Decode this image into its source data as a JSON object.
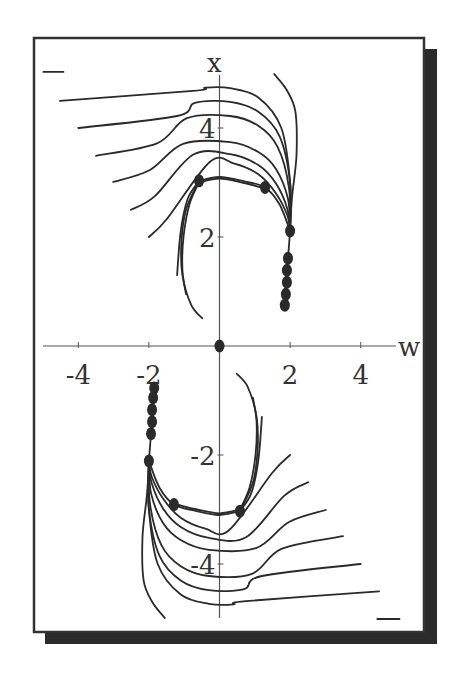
{
  "chart_data": {
    "type": "line",
    "title": "",
    "xlabel": "w",
    "ylabel": "x",
    "xlim": [
      -5.1,
      5.1
    ],
    "ylim": [
      -5.2,
      5.5
    ],
    "grid": false,
    "legend": null,
    "x_ticks": [
      {
        "value": -4,
        "label": "-4"
      },
      {
        "value": -2,
        "label": "-2"
      },
      {
        "value": 2,
        "label": "2"
      },
      {
        "value": 4,
        "label": "4"
      }
    ],
    "y_ticks": [
      {
        "value": 4,
        "label": "4"
      },
      {
        "value": 2,
        "label": "2"
      },
      {
        "value": -2,
        "label": "-2"
      },
      {
        "value": -4,
        "label": "-4"
      }
    ],
    "points": [
      {
        "w": 0.0,
        "x": 0.0
      },
      {
        "w": -0.58,
        "x": 3.03
      },
      {
        "w": 1.29,
        "x": 2.91
      },
      {
        "w": 2.0,
        "x": 2.11
      },
      {
        "w": 1.94,
        "x": 1.61
      },
      {
        "w": 1.91,
        "x": 1.39
      },
      {
        "w": 1.91,
        "x": 1.17
      },
      {
        "w": 1.88,
        "x": 0.95
      },
      {
        "w": 1.85,
        "x": 0.75
      },
      {
        "w": 0.58,
        "x": -3.03
      },
      {
        "w": -1.29,
        "x": -2.91
      },
      {
        "w": -2.0,
        "x": -2.11
      },
      {
        "w": -1.94,
        "x": -1.61
      },
      {
        "w": -1.91,
        "x": -1.39
      },
      {
        "w": -1.91,
        "x": -1.17
      },
      {
        "w": -1.88,
        "x": -0.95
      },
      {
        "w": -1.85,
        "x": -0.77
      }
    ],
    "series": [
      {
        "name": "upper-outer-1",
        "points": [
          [
            -4.52,
            4.5
          ],
          [
            -0.75,
            4.68
          ],
          [
            -0.4,
            4.74
          ],
          [
            0.3,
            4.73
          ],
          [
            1.1,
            4.56
          ],
          [
            1.75,
            4.0
          ],
          [
            2.0,
            3.0
          ],
          [
            2.0,
            2.11
          ]
        ]
      },
      {
        "name": "upper-outer-2",
        "points": [
          [
            -4.0,
            4.0
          ],
          [
            -1.2,
            4.22
          ],
          [
            -0.7,
            4.46
          ],
          [
            0.3,
            4.48
          ],
          [
            1.1,
            4.3
          ],
          [
            1.7,
            3.85
          ],
          [
            2.0,
            3.0
          ],
          [
            2.0,
            2.11
          ]
        ]
      },
      {
        "name": "upper-outer-3",
        "points": [
          [
            -3.5,
            3.49
          ],
          [
            -1.77,
            3.72
          ],
          [
            -0.92,
            4.18
          ],
          [
            0.3,
            4.22
          ],
          [
            1.1,
            4.04
          ],
          [
            1.65,
            3.65
          ],
          [
            1.97,
            2.9
          ],
          [
            2.0,
            2.11
          ]
        ]
      },
      {
        "name": "upper-outer-4",
        "points": [
          [
            -3.01,
            3.01
          ],
          [
            -1.97,
            3.23
          ],
          [
            -1.03,
            3.71
          ],
          [
            0.3,
            3.74
          ],
          [
            1.1,
            3.56
          ],
          [
            1.6,
            3.25
          ],
          [
            1.94,
            2.7
          ],
          [
            2.0,
            2.11
          ]
        ]
      },
      {
        "name": "upper-outer-5",
        "points": [
          [
            -2.51,
            2.5
          ],
          [
            -1.83,
            2.75
          ],
          [
            -0.75,
            3.51
          ],
          [
            0.3,
            3.52
          ],
          [
            1.1,
            3.32
          ],
          [
            1.6,
            2.98
          ],
          [
            1.92,
            2.52
          ],
          [
            2.0,
            2.11
          ]
        ]
      },
      {
        "name": "upper-outer-6",
        "points": [
          [
            -2.0,
            2.0
          ],
          [
            -1.49,
            2.33
          ],
          [
            -0.27,
            3.38
          ],
          [
            0.4,
            3.35
          ],
          [
            1.1,
            3.15
          ],
          [
            1.6,
            2.8
          ],
          [
            1.92,
            2.4
          ],
          [
            2.0,
            2.11
          ]
        ]
      },
      {
        "name": "upper-separatrix-a",
        "points": [
          [
            -0.58,
            3.03
          ],
          [
            0.0,
            3.1
          ],
          [
            0.7,
            3.02
          ],
          [
            1.29,
            2.91
          ],
          [
            1.7,
            2.6
          ],
          [
            2.0,
            2.11
          ]
        ]
      },
      {
        "name": "upper-separatrix-b",
        "points": [
          [
            -0.58,
            3.0
          ],
          [
            0.0,
            3.07
          ],
          [
            0.7,
            2.99
          ],
          [
            1.29,
            2.89
          ]
        ]
      },
      {
        "name": "upper-hook",
        "points": [
          [
            1.55,
            4.99
          ],
          [
            1.9,
            4.7
          ],
          [
            2.15,
            4.3
          ],
          [
            2.18,
            3.5
          ],
          [
            2.05,
            2.7
          ],
          [
            2.0,
            2.11
          ]
        ]
      },
      {
        "name": "upper-vertical",
        "points": [
          [
            2.0,
            2.11
          ],
          [
            1.94,
            1.61
          ],
          [
            1.85,
            0.75
          ]
        ]
      },
      {
        "name": "upper-inner-1",
        "points": [
          [
            -0.58,
            3.03
          ],
          [
            -0.9,
            2.7
          ],
          [
            -1.1,
            2.1
          ],
          [
            -1.2,
            1.3
          ]
        ]
      },
      {
        "name": "upper-inner-2",
        "points": [
          [
            -0.58,
            3.0
          ],
          [
            -0.85,
            2.6
          ],
          [
            -1.02,
            2.0
          ],
          [
            -1.05,
            1.4
          ],
          [
            -0.95,
            0.95
          ]
        ]
      },
      {
        "name": "upper-inner-3",
        "points": [
          [
            -0.62,
            2.98
          ],
          [
            -0.95,
            2.5
          ],
          [
            -1.08,
            1.9
          ],
          [
            -1.05,
            1.3
          ],
          [
            -0.8,
            0.75
          ],
          [
            -0.49,
            0.51
          ]
        ]
      },
      {
        "name": "lower-outer-1",
        "points": [
          [
            4.52,
            -4.5
          ],
          [
            0.75,
            -4.68
          ],
          [
            0.4,
            -4.74
          ],
          [
            -0.3,
            -4.73
          ],
          [
            -1.1,
            -4.56
          ],
          [
            -1.75,
            -4.0
          ],
          [
            -2.0,
            -3.0
          ],
          [
            -2.0,
            -2.11
          ]
        ]
      },
      {
        "name": "lower-outer-2",
        "points": [
          [
            4.0,
            -4.0
          ],
          [
            1.2,
            -4.22
          ],
          [
            0.7,
            -4.46
          ],
          [
            -0.3,
            -4.48
          ],
          [
            -1.1,
            -4.3
          ],
          [
            -1.7,
            -3.85
          ],
          [
            -2.0,
            -3.0
          ],
          [
            -2.0,
            -2.11
          ]
        ]
      },
      {
        "name": "lower-outer-3",
        "points": [
          [
            3.5,
            -3.49
          ],
          [
            1.77,
            -3.72
          ],
          [
            0.92,
            -4.18
          ],
          [
            -0.3,
            -4.22
          ],
          [
            -1.1,
            -4.04
          ],
          [
            -1.65,
            -3.65
          ],
          [
            -1.97,
            -2.9
          ],
          [
            -2.0,
            -2.11
          ]
        ]
      },
      {
        "name": "lower-outer-4",
        "points": [
          [
            3.01,
            -3.01
          ],
          [
            1.97,
            -3.23
          ],
          [
            1.03,
            -3.71
          ],
          [
            -0.3,
            -3.74
          ],
          [
            -1.1,
            -3.56
          ],
          [
            -1.6,
            -3.25
          ],
          [
            -1.94,
            -2.7
          ],
          [
            -2.0,
            -2.11
          ]
        ]
      },
      {
        "name": "lower-outer-5",
        "points": [
          [
            2.51,
            -2.5
          ],
          [
            1.83,
            -2.75
          ],
          [
            0.75,
            -3.51
          ],
          [
            -0.3,
            -3.52
          ],
          [
            -1.1,
            -3.32
          ],
          [
            -1.6,
            -2.98
          ],
          [
            -1.92,
            -2.52
          ],
          [
            -2.0,
            -2.11
          ]
        ]
      },
      {
        "name": "lower-outer-6",
        "points": [
          [
            2.0,
            -2.0
          ],
          [
            1.49,
            -2.33
          ],
          [
            0.27,
            -3.38
          ],
          [
            -0.4,
            -3.35
          ],
          [
            -1.1,
            -3.15
          ],
          [
            -1.6,
            -2.8
          ],
          [
            -1.92,
            -2.4
          ],
          [
            -2.0,
            -2.11
          ]
        ]
      },
      {
        "name": "lower-separatrix-a",
        "points": [
          [
            0.58,
            -3.03
          ],
          [
            0.0,
            -3.1
          ],
          [
            -0.7,
            -3.02
          ],
          [
            -1.29,
            -2.91
          ],
          [
            -1.7,
            -2.6
          ],
          [
            -2.0,
            -2.11
          ]
        ]
      },
      {
        "name": "lower-separatrix-b",
        "points": [
          [
            0.58,
            -3.0
          ],
          [
            0.0,
            -3.07
          ],
          [
            -0.7,
            -2.99
          ],
          [
            -1.29,
            -2.89
          ]
        ]
      },
      {
        "name": "lower-hook",
        "points": [
          [
            -1.55,
            -4.99
          ],
          [
            -1.9,
            -4.7
          ],
          [
            -2.15,
            -4.3
          ],
          [
            -2.18,
            -3.5
          ],
          [
            -2.05,
            -2.7
          ],
          [
            -2.0,
            -2.11
          ]
        ]
      },
      {
        "name": "lower-vertical",
        "points": [
          [
            -2.0,
            -2.11
          ],
          [
            -1.94,
            -1.61
          ],
          [
            -1.85,
            -0.77
          ]
        ]
      },
      {
        "name": "lower-inner-1",
        "points": [
          [
            0.58,
            -3.03
          ],
          [
            0.9,
            -2.7
          ],
          [
            1.1,
            -2.1
          ],
          [
            1.2,
            -1.3
          ]
        ]
      },
      {
        "name": "lower-inner-2",
        "points": [
          [
            0.58,
            -3.0
          ],
          [
            0.85,
            -2.6
          ],
          [
            1.02,
            -2.0
          ],
          [
            1.05,
            -1.4
          ],
          [
            0.95,
            -0.95
          ]
        ]
      },
      {
        "name": "lower-inner-3",
        "points": [
          [
            0.62,
            -2.98
          ],
          [
            0.95,
            -2.5
          ],
          [
            1.08,
            -1.9
          ],
          [
            1.05,
            -1.3
          ],
          [
            0.8,
            -0.75
          ],
          [
            0.49,
            -0.51
          ]
        ]
      },
      {
        "name": "stub-top-left",
        "points": [
          [
            -4.99,
            5.03
          ],
          [
            -4.42,
            5.03
          ]
        ]
      },
      {
        "name": "stub-bottom-right",
        "points": [
          [
            4.47,
            -5.01
          ],
          [
            5.1,
            -5.01
          ]
        ]
      }
    ]
  },
  "style": {
    "line_color": "#2a2a2a",
    "axis_color": "#555555",
    "point_color": "#2a2a2a",
    "frame_color": "#333333",
    "shadow_color": "#2b2b2b",
    "background": "#ffffff"
  }
}
